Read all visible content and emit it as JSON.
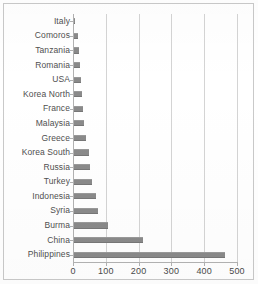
{
  "chart_data": {
    "type": "bar",
    "orientation": "horizontal",
    "title": "",
    "xlabel": "",
    "ylabel": "",
    "xlim": [
      0,
      500
    ],
    "ylim": null,
    "grid": true,
    "legend": false,
    "xticks": [
      0,
      100,
      200,
      300,
      400,
      500
    ],
    "xticklabels": [
      "0",
      "100",
      "200",
      "300",
      "400",
      "500"
    ],
    "bar_color": "#8a8a8a",
    "gridline_color": "#d4d4d4",
    "axis_color": "#b2b2b2",
    "categories": [
      "Italy",
      "Comoros",
      "Tanzania",
      "Romania",
      "USA",
      "Korea North",
      "France",
      "Malaysia",
      "Greece",
      "Korea South",
      "Russia",
      "Turkey",
      "Indonesia",
      "Syria",
      "Burma",
      "China",
      "Philippines"
    ],
    "values": [
      6,
      14,
      17,
      20,
      23,
      26,
      30,
      35,
      40,
      48,
      53,
      58,
      70,
      77,
      106,
      213,
      463
    ],
    "points": [
      {
        "category": "Italy",
        "value": 6
      },
      {
        "category": "Comoros",
        "value": 14
      },
      {
        "category": "Tanzania",
        "value": 17
      },
      {
        "category": "Romania",
        "value": 20
      },
      {
        "category": "USA",
        "value": 23
      },
      {
        "category": "Korea North",
        "value": 26
      },
      {
        "category": "France",
        "value": 30
      },
      {
        "category": "Malaysia",
        "value": 35
      },
      {
        "category": "Greece",
        "value": 40
      },
      {
        "category": "Korea South",
        "value": 48
      },
      {
        "category": "Russia",
        "value": 53
      },
      {
        "category": "Turkey",
        "value": 58
      },
      {
        "category": "Indonesia",
        "value": 70
      },
      {
        "category": "Syria",
        "value": 77
      },
      {
        "category": "Burma",
        "value": 106
      },
      {
        "category": "China",
        "value": 213
      },
      {
        "category": "Philippines",
        "value": 463
      }
    ]
  }
}
